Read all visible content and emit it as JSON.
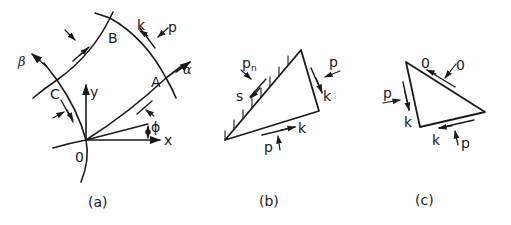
{
  "panels": [
    {
      "id": "a",
      "caption": "(a)",
      "labels": {
        "origin": "0",
        "x_axis": "x",
        "y_axis": "y",
        "alpha": "α",
        "beta": "β",
        "point_a": "A",
        "point_b": "B",
        "point_c": "C",
        "angle": "ϕ",
        "shear": "k",
        "pressure": "p"
      }
    },
    {
      "id": "b",
      "caption": "(b)",
      "labels": {
        "normal_pressure": "p",
        "normal_pressure_sub": "n",
        "friction": "s",
        "right_pressure": "p",
        "right_shear": "k",
        "bottom_pressure": "p",
        "bottom_shear": "k"
      }
    },
    {
      "id": "c",
      "caption": "(c)",
      "labels": {
        "top_shear": "0",
        "top_pressure": "0",
        "left_pressure": "p",
        "left_shear": "k",
        "bottom_shear": "k",
        "bottom_pressure": "p"
      }
    }
  ],
  "colors": {
    "ink": "#1a1a1a",
    "background": "#ffffff"
  }
}
